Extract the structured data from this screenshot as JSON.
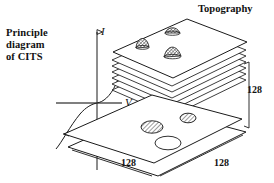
{
  "diagram": {
    "title_lines": [
      "Principle",
      "diagram",
      "of CITS"
    ],
    "title_text": "Principle diagram of CITS",
    "topography_label": "Topography",
    "axes": {
      "current_axis_label": "I",
      "voltage_axis_label": "V",
      "curve_name": "tunneling-iv-curve"
    },
    "dimensions": {
      "vertical": "128",
      "bottom_left": "128",
      "bottom_right": "128"
    },
    "stack": {
      "sheet_count": 6,
      "top_plane_features": 3,
      "bottom_plane_features": 3
    },
    "colors": {
      "stroke": "#1a1a1a",
      "background": "#ffffff",
      "hatch": "#555555"
    }
  }
}
